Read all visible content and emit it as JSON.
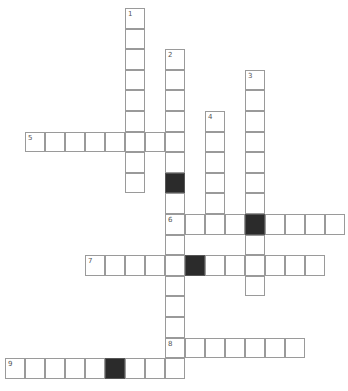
{
  "puzzle": {
    "type": "crossword",
    "cell_size": 20,
    "origin_x": 5,
    "origin_y": 8,
    "row_height": 20.6,
    "colors": {
      "black": "#2b2b2b",
      "border": "#9a9a9a",
      "number": "#555555"
    }
  },
  "entries": [
    {
      "number": "1",
      "direction": "down",
      "col": 6,
      "row": 0,
      "length": 9,
      "blacks": []
    },
    {
      "number": "2",
      "direction": "down",
      "col": 8,
      "row": 2,
      "length": 16,
      "blacks": [
        6
      ]
    },
    {
      "number": "3",
      "direction": "down",
      "col": 12,
      "row": 3,
      "length": 11,
      "blacks": [
        7
      ]
    },
    {
      "number": "4",
      "direction": "down",
      "col": 10,
      "row": 5,
      "length": 6,
      "blacks": []
    },
    {
      "number": "5",
      "direction": "across",
      "col": 1,
      "row": 6,
      "length": 8,
      "blacks": []
    },
    {
      "number": "6",
      "direction": "across",
      "col": 8,
      "row": 10,
      "length": 9,
      "blacks": [
        4
      ]
    },
    {
      "number": "7",
      "direction": "across",
      "col": 4,
      "row": 12,
      "length": 12,
      "blacks": [
        5
      ]
    },
    {
      "number": "8",
      "direction": "across",
      "col": 8,
      "row": 16,
      "length": 7,
      "blacks": []
    },
    {
      "number": "9",
      "direction": "across",
      "col": 0,
      "row": 17,
      "length": 9,
      "blacks": [
        5
      ]
    }
  ]
}
